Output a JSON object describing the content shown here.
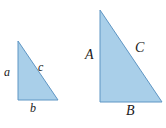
{
  "figure": {
    "kind": "similar-right-triangles",
    "background_color": "#ffffff",
    "fill_color": "#a9cfe9",
    "stroke_color": "#5f96c4",
    "label_color": "#1a1a1a"
  },
  "small_triangle": {
    "name": "small-right-triangle",
    "vertices": {
      "apex": [
        18,
        41
      ],
      "bottom_left": [
        18,
        100
      ],
      "bottom_right": [
        58,
        100
      ]
    },
    "labels": {
      "leg_vertical": "a",
      "leg_horizontal": "b",
      "hypotenuse": "c"
    }
  },
  "large_triangle": {
    "name": "large-right-triangle",
    "vertices": {
      "apex": [
        100,
        10
      ],
      "bottom_left": [
        100,
        102
      ],
      "bottom_right": [
        162,
        102
      ]
    },
    "labels": {
      "leg_vertical": "A",
      "leg_horizontal": "B",
      "hypotenuse": "C"
    }
  }
}
